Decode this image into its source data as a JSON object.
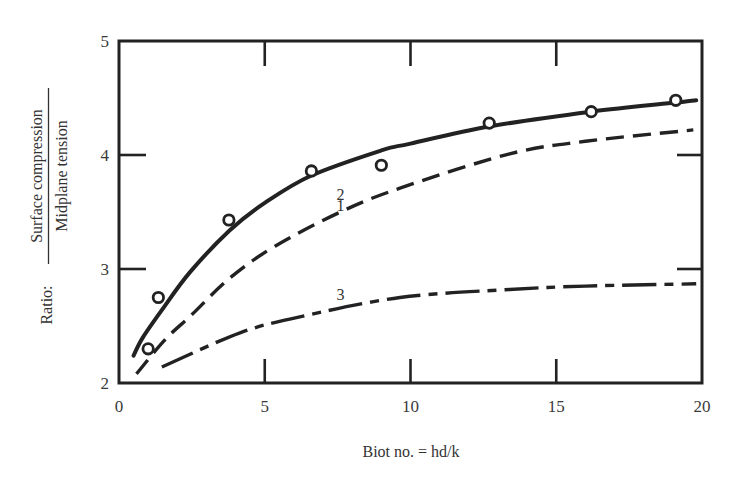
{
  "chart_data": {
    "type": "line",
    "title": "",
    "xlabel": "Biot no. = hd/k",
    "ylabel": {
      "prefix": "Ratio:",
      "numerator": "Surface compression",
      "denominator": "Midplane tension"
    },
    "xlim": [
      0,
      20
    ],
    "ylim": [
      2,
      5
    ],
    "x_ticks": [
      0,
      5,
      10,
      15,
      20
    ],
    "y_ticks": [
      2,
      3,
      4,
      5
    ],
    "x_tick_labels": [
      "0",
      "5",
      "10",
      "15",
      "20"
    ],
    "y_tick_labels": [
      "2",
      "3",
      "4",
      "5"
    ],
    "grid": false,
    "legend": "inline curve labels",
    "series": [
      {
        "name": "1",
        "style": "solid",
        "label_pos": [
          7.6,
          3.56
        ],
        "x": [
          0.5,
          0.82,
          1.5,
          2.43,
          3.8,
          5,
          6.6,
          9,
          10,
          12.7,
          16.2,
          19.1,
          19.8
        ],
        "y": [
          2.24,
          2.4,
          2.65,
          2.97,
          3.34,
          3.58,
          3.82,
          4.04,
          4.1,
          4.25,
          4.38,
          4.46,
          4.48
        ]
      },
      {
        "name": "2",
        "style": "dashed",
        "label_pos": [
          7.6,
          3.66
        ],
        "x": [
          0.6,
          1.58,
          2.5,
          3.8,
          5.35,
          7.6,
          9.64,
          13.4,
          16,
          19.7
        ],
        "y": [
          2.08,
          2.38,
          2.6,
          2.92,
          3.2,
          3.5,
          3.71,
          4.01,
          4.12,
          4.22
        ]
      },
      {
        "name": "3",
        "style": "dash-dot",
        "label_pos": [
          7.6,
          2.78
        ],
        "x": [
          1.47,
          4.15,
          6.2,
          9.64,
          13.4,
          16,
          19.8
        ],
        "y": [
          2.14,
          2.44,
          2.58,
          2.75,
          2.82,
          2.85,
          2.87
        ]
      }
    ],
    "points": {
      "name": "experimental data",
      "marker": "open-circle",
      "x": [
        1.0,
        1.35,
        3.77,
        6.6,
        9.0,
        12.7,
        16.2,
        19.1
      ],
      "y": [
        2.3,
        2.75,
        3.43,
        3.86,
        3.91,
        4.28,
        4.38,
        4.48
      ]
    }
  },
  "colors": {
    "ink": "#222222",
    "background": "#ffffff"
  }
}
